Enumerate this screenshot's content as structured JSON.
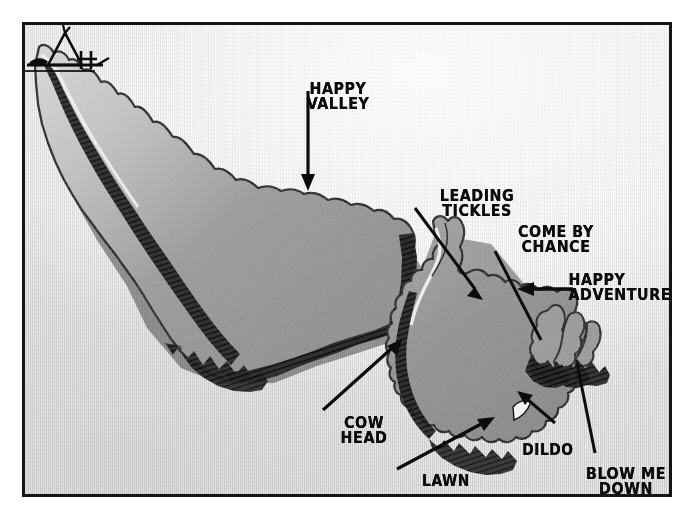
{
  "cartoon": {
    "title": "Newfoundland and Labrador place-name map cartoon",
    "artist_signature": "deAdder",
    "frame_color": "#151515",
    "paper_color": "#d7d7d7",
    "land_fill": "#8e8e8e",
    "land_fill_light": "#c9c9c9",
    "ink_color": "#0c0c0c",
    "labels": [
      {
        "id": "happy-valley",
        "text": "HAPPY\nVALLEY",
        "pointer": "arrow-down",
        "place": "Happy Valley"
      },
      {
        "id": "leading-tickles",
        "text": "LEADING\nTICKLES",
        "pointer": "arrow-down-right",
        "place": "Leading Tickles"
      },
      {
        "id": "come-by-chance",
        "text": "COME BY\nCHANCE",
        "pointer": "line-down-right",
        "place": "Come By Chance"
      },
      {
        "id": "happy-adventure",
        "text": "HAPPY\nADVENTURE",
        "pointer": "arrow-left",
        "place": "Happy Adventure"
      },
      {
        "id": "cow-head",
        "text": "COW\nHEAD",
        "pointer": "arrow-up-right",
        "place": "Cow Head"
      },
      {
        "id": "lawn",
        "text": "LAWN",
        "pointer": "arrow-up-right",
        "place": "Lawn"
      },
      {
        "id": "dildo",
        "text": "DILDO",
        "pointer": "arrow-up-right",
        "place": "Dildo"
      },
      {
        "id": "blow-me-down",
        "text": "BLOW ME\nDOWN",
        "pointer": "line-up-left",
        "place": "Blow Me Down"
      }
    ],
    "landmasses": [
      {
        "id": "labrador",
        "name": "Labrador mainland"
      },
      {
        "id": "newfoundland",
        "name": "Island of Newfoundland"
      },
      {
        "id": "east-islets",
        "name": "Eastern peninsulas and islets"
      }
    ]
  }
}
